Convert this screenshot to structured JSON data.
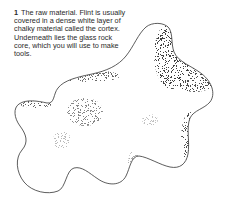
{
  "caption": {
    "number": "1",
    "title": "The raw material.",
    "text": "Flint is usually covered in a dense white layer of chalky material called the cortex. Underneath lies the glass rock core, which you will use to make tools."
  },
  "illustration": {
    "subject": "flint nodule",
    "style": "stippled line drawing",
    "outline_color": "#333333",
    "shading_color": "#555555",
    "background_color": "#ffffff"
  }
}
